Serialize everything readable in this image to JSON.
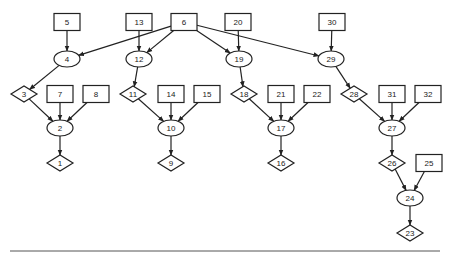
{
  "diagram": {
    "type": "directed-graph",
    "nodes": [
      {
        "id": "5",
        "shape": "box"
      },
      {
        "id": "13",
        "shape": "box"
      },
      {
        "id": "6",
        "shape": "box"
      },
      {
        "id": "20",
        "shape": "box"
      },
      {
        "id": "30",
        "shape": "box"
      },
      {
        "id": "4",
        "shape": "ellipse"
      },
      {
        "id": "12",
        "shape": "ellipse"
      },
      {
        "id": "19",
        "shape": "ellipse"
      },
      {
        "id": "29",
        "shape": "ellipse"
      },
      {
        "id": "3",
        "shape": "diamond"
      },
      {
        "id": "7",
        "shape": "box"
      },
      {
        "id": "8",
        "shape": "box"
      },
      {
        "id": "11",
        "shape": "diamond"
      },
      {
        "id": "14",
        "shape": "box"
      },
      {
        "id": "15",
        "shape": "box"
      },
      {
        "id": "18",
        "shape": "diamond"
      },
      {
        "id": "21",
        "shape": "box"
      },
      {
        "id": "22",
        "shape": "box"
      },
      {
        "id": "28",
        "shape": "diamond"
      },
      {
        "id": "31",
        "shape": "box"
      },
      {
        "id": "32",
        "shape": "box"
      },
      {
        "id": "2",
        "shape": "ellipse"
      },
      {
        "id": "10",
        "shape": "ellipse"
      },
      {
        "id": "17",
        "shape": "ellipse"
      },
      {
        "id": "27",
        "shape": "ellipse"
      },
      {
        "id": "1",
        "shape": "diamond"
      },
      {
        "id": "9",
        "shape": "diamond"
      },
      {
        "id": "16",
        "shape": "diamond"
      },
      {
        "id": "26",
        "shape": "diamond"
      },
      {
        "id": "25",
        "shape": "box"
      },
      {
        "id": "24",
        "shape": "ellipse"
      },
      {
        "id": "23",
        "shape": "diamond"
      }
    ],
    "edges": [
      {
        "from": "5",
        "to": "4"
      },
      {
        "from": "6",
        "to": "4"
      },
      {
        "from": "13",
        "to": "12"
      },
      {
        "from": "6",
        "to": "12"
      },
      {
        "from": "6",
        "to": "19"
      },
      {
        "from": "20",
        "to": "19"
      },
      {
        "from": "6",
        "to": "29"
      },
      {
        "from": "30",
        "to": "29"
      },
      {
        "from": "4",
        "to": "3"
      },
      {
        "from": "12",
        "to": "11"
      },
      {
        "from": "19",
        "to": "18"
      },
      {
        "from": "29",
        "to": "28"
      },
      {
        "from": "3",
        "to": "2"
      },
      {
        "from": "7",
        "to": "2"
      },
      {
        "from": "8",
        "to": "2"
      },
      {
        "from": "11",
        "to": "10"
      },
      {
        "from": "14",
        "to": "10"
      },
      {
        "from": "15",
        "to": "10"
      },
      {
        "from": "18",
        "to": "17"
      },
      {
        "from": "21",
        "to": "17"
      },
      {
        "from": "22",
        "to": "17"
      },
      {
        "from": "28",
        "to": "27"
      },
      {
        "from": "31",
        "to": "27"
      },
      {
        "from": "32",
        "to": "27"
      },
      {
        "from": "2",
        "to": "1"
      },
      {
        "from": "10",
        "to": "9"
      },
      {
        "from": "17",
        "to": "16"
      },
      {
        "from": "27",
        "to": "26"
      },
      {
        "from": "26",
        "to": "24"
      },
      {
        "from": "25",
        "to": "24"
      },
      {
        "from": "24",
        "to": "23"
      }
    ]
  }
}
